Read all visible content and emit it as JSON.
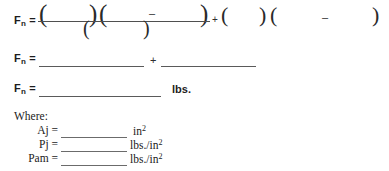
{
  "document": {
    "type": "fill-in-the-blank engineering worksheet",
    "background_color": "#ffffff",
    "ink_color": "#1d1d1d"
  },
  "formula_line_1": {
    "label": "F",
    "label_subscript": "n",
    "equals": "=",
    "numerator": {
      "group_1": {
        "open": "(",
        "blank": "",
        "close": ")"
      },
      "group_2": {
        "open": "(",
        "blank_left": "",
        "operator": "–",
        "blank_right": "",
        "close": ")"
      }
    },
    "denominator": {
      "group_1": {
        "open": "(",
        "blank": "",
        "close": ")"
      }
    },
    "operator": "+",
    "trailing": {
      "group_1": {
        "open": "(",
        "blank": "",
        "close": ")"
      },
      "group_2": {
        "open": "(",
        "blank_left": "",
        "operator": "–",
        "blank_right": "",
        "close": ")"
      }
    }
  },
  "formula_line_2": {
    "label": "F",
    "label_subscript": "n",
    "equals": "=",
    "blank_1": "",
    "operator": "+",
    "blank_2": ""
  },
  "formula_line_3": {
    "label": "F",
    "label_subscript": "n",
    "equals": "=",
    "blank": "",
    "unit": "lbs."
  },
  "where": {
    "title": "Where:",
    "items": [
      {
        "label": "Aj",
        "equals": "=",
        "value": "",
        "unit": "in",
        "unit_superscript": "2"
      },
      {
        "label": "Pj",
        "equals": "=",
        "value": "",
        "unit": "lbs./in",
        "unit_superscript": "2"
      },
      {
        "label": "Pam",
        "equals": "=",
        "value": "",
        "unit": "lbs./in",
        "unit_superscript": "2"
      }
    ]
  }
}
